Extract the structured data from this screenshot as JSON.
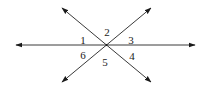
{
  "diagram": {
    "lines": [
      {
        "name": "horizontal-line",
        "arrows": "both"
      },
      {
        "name": "rising-diagonal-line",
        "arrows": "both"
      },
      {
        "name": "falling-diagonal-line",
        "arrows": "both"
      }
    ],
    "angle_labels": [
      "1",
      "2",
      "3",
      "4",
      "5",
      "6"
    ],
    "colors": {
      "line": "#3a3a3a",
      "text": "#222222",
      "background": "#ffffff"
    }
  }
}
